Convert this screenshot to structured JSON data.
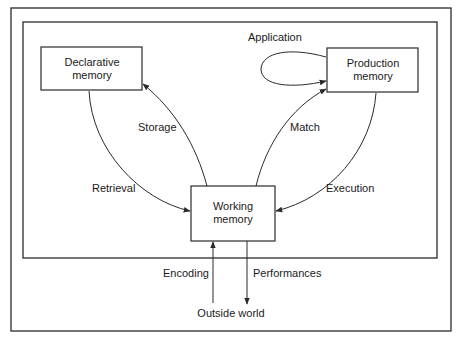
{
  "diagram": {
    "nodes": {
      "declarative": {
        "line1": "Declarative",
        "line2": "memory"
      },
      "production": {
        "line1": "Production",
        "line2": "memory"
      },
      "working": {
        "line1": "Working",
        "line2": "memory"
      },
      "outside": {
        "label": "Outside world"
      }
    },
    "edges": {
      "application": {
        "label": "Application",
        "from": "production",
        "to": "production"
      },
      "storage": {
        "label": "Storage",
        "from": "working",
        "to": "declarative"
      },
      "retrieval": {
        "label": "Retrieval",
        "from": "declarative",
        "to": "working"
      },
      "match": {
        "label": "Match",
        "from": "working",
        "to": "production"
      },
      "execution": {
        "label": "Execution",
        "from": "production",
        "to": "working"
      },
      "encoding": {
        "label": "Encoding",
        "from": "outside",
        "to": "working"
      },
      "performances": {
        "label": "Performances",
        "from": "working",
        "to": "outside"
      }
    },
    "colors": {
      "stroke": "#2a2a2a",
      "text": "#1a1a1a",
      "background": "#ffffff"
    }
  }
}
